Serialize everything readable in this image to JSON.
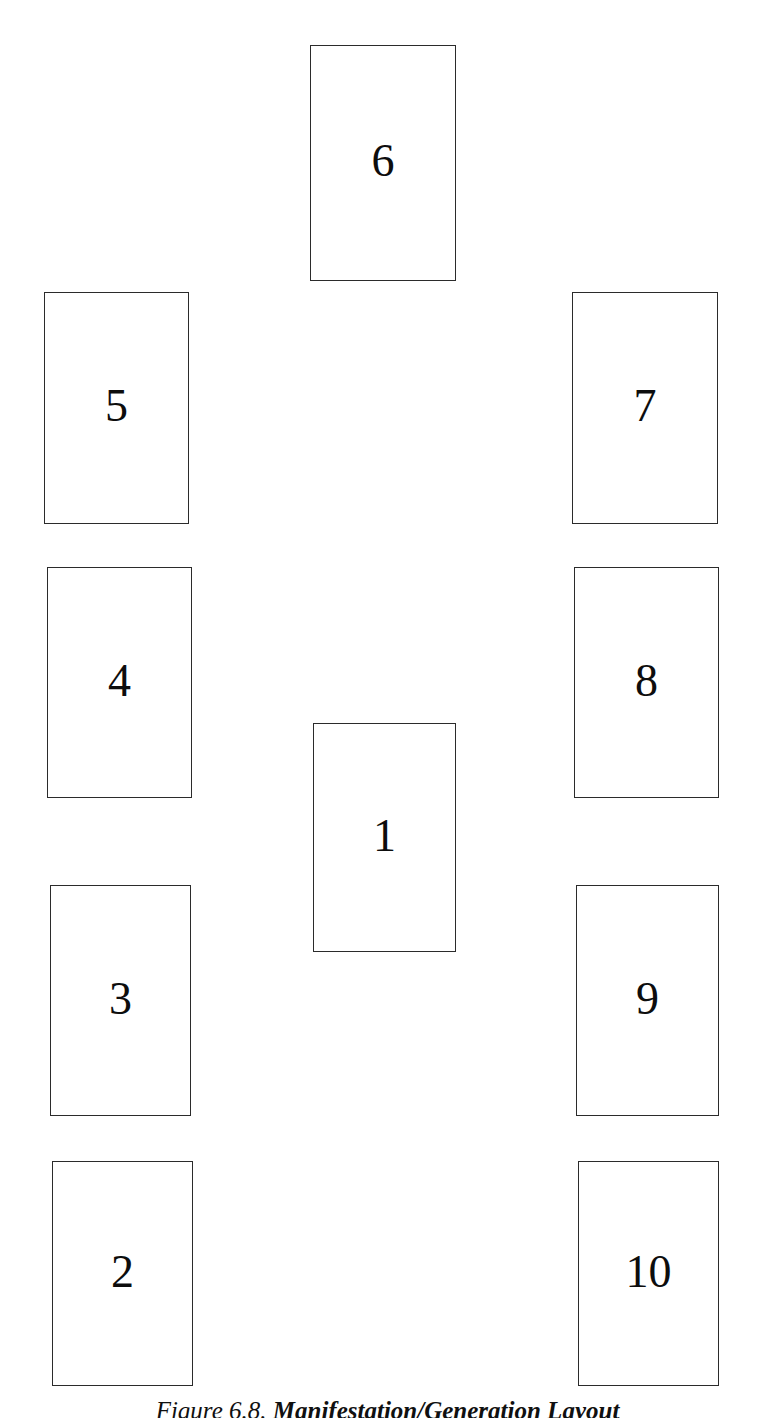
{
  "figure": {
    "caption_label": "Figure 6.8.",
    "caption_title": "Manifestation/Generation Layout",
    "background_color": "#ffffff",
    "card_border_color": "#2b2b2b",
    "card_fill_color": "#ffffff",
    "number_color": "#0d0d0d"
  },
  "cards": [
    {
      "position": 1,
      "label": "6",
      "name": "card-position-6",
      "column": "center",
      "row": "top",
      "x": 310,
      "y": 45,
      "width": 146,
      "height": 236
    },
    {
      "position": 2,
      "label": "5",
      "name": "card-position-5",
      "column": "left",
      "row": "upper",
      "x": 44,
      "y": 292,
      "width": 145,
      "height": 232
    },
    {
      "position": 3,
      "label": "7",
      "name": "card-position-7",
      "column": "right",
      "row": "upper",
      "x": 572,
      "y": 292,
      "width": 146,
      "height": 232
    },
    {
      "position": 4,
      "label": "4",
      "name": "card-position-4",
      "column": "left",
      "row": "upper-middle",
      "x": 47,
      "y": 567,
      "width": 145,
      "height": 231
    },
    {
      "position": 5,
      "label": "8",
      "name": "card-position-8",
      "column": "right",
      "row": "upper-middle",
      "x": 574,
      "y": 567,
      "width": 145,
      "height": 231
    },
    {
      "position": 6,
      "label": "1",
      "name": "card-position-1",
      "column": "center",
      "row": "middle",
      "x": 313,
      "y": 723,
      "width": 143,
      "height": 229
    },
    {
      "position": 7,
      "label": "3",
      "name": "card-position-3",
      "column": "left",
      "row": "lower-middle",
      "x": 50,
      "y": 885,
      "width": 141,
      "height": 231
    },
    {
      "position": 8,
      "label": "9",
      "name": "card-position-9",
      "column": "right",
      "row": "lower-middle",
      "x": 576,
      "y": 885,
      "width": 143,
      "height": 231
    },
    {
      "position": 9,
      "label": "2",
      "name": "card-position-2",
      "column": "left",
      "row": "bottom",
      "x": 52,
      "y": 1161,
      "width": 141,
      "height": 225
    },
    {
      "position": 10,
      "label": "10",
      "name": "card-position-10",
      "column": "right",
      "row": "bottom",
      "x": 578,
      "y": 1161,
      "width": 141,
      "height": 225
    }
  ]
}
